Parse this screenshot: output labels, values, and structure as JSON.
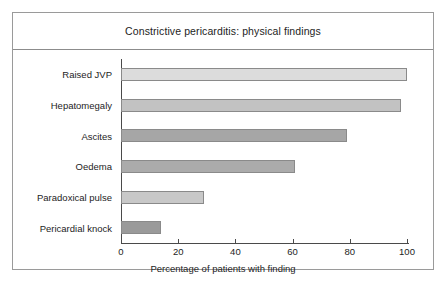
{
  "figure": {
    "title": "Constrictive pericarditis: physical findings"
  },
  "chart_data": {
    "type": "bar",
    "orientation": "horizontal",
    "title": "Constrictive pericarditis: physical findings",
    "xlabel": "Percentage of patients with finding",
    "ylabel": "",
    "categories": [
      "Raised JVP",
      "Hepatomegaly",
      "Ascites",
      "Oedema",
      "Paradoxical pulse",
      "Pericardial knock"
    ],
    "values": [
      100,
      98,
      79,
      61,
      29,
      14
    ],
    "bar_colors": [
      "#dcdcdc",
      "#c2c2c2",
      "#a6a6a6",
      "#ababab",
      "#c8c8c8",
      "#9a9a9a"
    ],
    "xlim": [
      0,
      100
    ],
    "xticks": [
      0,
      20,
      40,
      60,
      80,
      100
    ],
    "xtick_labels": [
      "0",
      "20",
      "40",
      "60",
      "80",
      "100"
    ],
    "grid": false,
    "legend": false
  }
}
